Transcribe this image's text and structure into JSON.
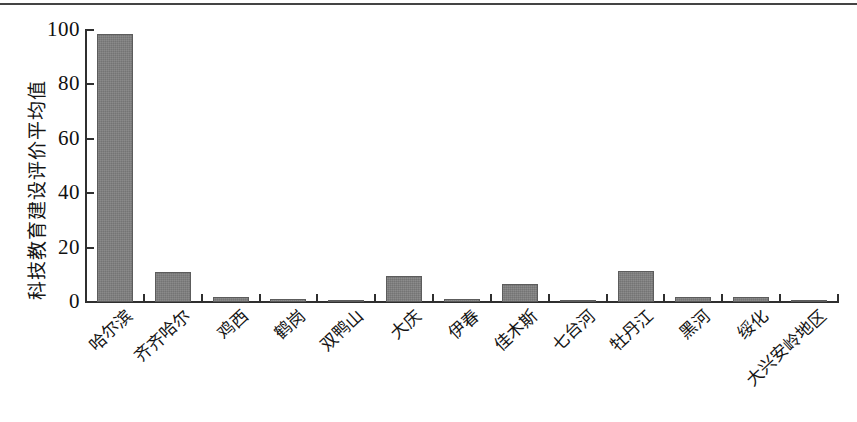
{
  "chart_data": {
    "type": "bar",
    "title": "",
    "xlabel": "",
    "ylabel": "科技教育建设评价平均值",
    "ylim": [
      0,
      100
    ],
    "yticks": [
      0,
      20,
      40,
      60,
      80,
      100
    ],
    "ytick_labels": [
      "0",
      "20",
      "40",
      "60",
      "80",
      "100"
    ],
    "grid": false,
    "legend": null,
    "bar_color": "#7e7e7e",
    "axis_color": "#2f2f2f",
    "categories": [
      "哈尔滨",
      "齐齐哈尔",
      "鸡西",
      "鹤岗",
      "双鸭山",
      "大庆",
      "伊春",
      "佳木斯",
      "七台河",
      "牡丹江",
      "黑河",
      "绥化",
      "大兴安岭地区"
    ],
    "values": [
      98.5,
      11.0,
      1.8,
      1.1,
      0.8,
      9.6,
      1.0,
      6.6,
      0.9,
      11.4,
      1.7,
      1.8,
      0.9
    ]
  },
  "figure": {
    "background_color": "#ffffff",
    "has_top_rule": true
  }
}
